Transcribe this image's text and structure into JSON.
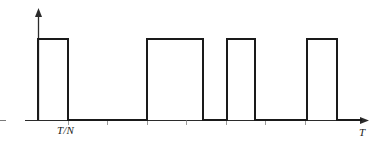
{
  "figure": {
    "stroke_color": "#1a1a1a",
    "background_color": "#ffffff",
    "axes": {
      "y_axis": {
        "name": "vertical-axis",
        "x": 38,
        "y_top": 10,
        "y_bottom": 121,
        "arrow": "up"
      },
      "x_axis": {
        "name": "horizontal-axis",
        "y": 120,
        "x_left": 25,
        "x_right": 368,
        "arrow": "right"
      },
      "labels": {
        "x_axis_label": "T",
        "pulse_width_label": "T/N"
      },
      "ticks": [
        {
          "x": 68,
          "label": ""
        },
        {
          "x": 107,
          "label": ""
        },
        {
          "x": 147,
          "label": ""
        },
        {
          "x": 186,
          "label": ""
        },
        {
          "x": 226,
          "label": ""
        },
        {
          "x": 265,
          "label": ""
        },
        {
          "x": 305,
          "label": ""
        }
      ]
    },
    "waveform": {
      "type": "square-wave",
      "baseline_y": 120,
      "high_level_y": 39,
      "amplitude": 81,
      "pulses": [
        {
          "index": 1,
          "rise_x": 38,
          "fall_x": 68,
          "width": 30
        },
        {
          "index": 2,
          "rise_x": 147,
          "fall_x": 203,
          "width": 56
        },
        {
          "index": 3,
          "rise_x": 227,
          "fall_x": 255,
          "width": 28
        },
        {
          "index": 4,
          "rise_x": 307,
          "fall_x": 337,
          "width": 30
        }
      ],
      "trailing_baseline_end_x": 362
    }
  },
  "chart_data": {
    "type": "line",
    "xlabel": "T",
    "ylabel": "",
    "grid": false,
    "legend": null,
    "annotations": [
      "T/N",
      "T"
    ],
    "xlim": [
      25,
      368
    ],
    "ylim": [
      0,
      1
    ],
    "series": [
      {
        "name": "pulse-train",
        "x": [
          38,
          38,
          68,
          68,
          147,
          147,
          203,
          203,
          227,
          227,
          255,
          255,
          307,
          307,
          337,
          337,
          362
        ],
        "values": [
          0,
          1,
          1,
          0,
          0,
          1,
          1,
          0,
          0,
          1,
          1,
          0,
          0,
          1,
          1,
          0,
          0
        ]
      }
    ]
  }
}
